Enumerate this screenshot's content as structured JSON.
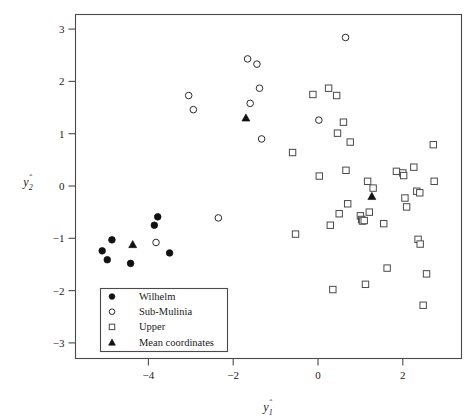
{
  "chart_data": {
    "type": "scatter",
    "title": "",
    "xlabel": "ŷ2̂",
    "axis_labels": {
      "x": "ŷ₁",
      "y": "ŷ₂"
    },
    "xlim": [
      -5.55,
      3.3
    ],
    "ylim": [
      -3.3,
      3.3
    ],
    "xticks": [
      -4,
      -2,
      0,
      2
    ],
    "yticks": [
      3,
      2,
      1,
      0,
      -1,
      -2,
      -3
    ],
    "xtick_labels": [
      "−4",
      "−2",
      "0",
      "2"
    ],
    "ytick_labels": [
      "3",
      "2",
      "1",
      "0",
      "−1",
      "−2",
      "−3"
    ],
    "grid": false,
    "legend_position": "lower-left",
    "series": [
      {
        "name": "Wilhelm",
        "marker": "filled-circle",
        "color": "#111111",
        "points": [
          [
            -5.09,
            -1.24
          ],
          [
            -4.97,
            -1.41
          ],
          [
            -4.86,
            -1.03
          ],
          [
            -4.42,
            -1.48
          ],
          [
            -3.86,
            -0.75
          ],
          [
            -3.78,
            -0.59
          ],
          [
            -3.5,
            -1.28
          ]
        ]
      },
      {
        "name": "Sub-Mulinia",
        "marker": "open-circle",
        "color": "#2b2b2b",
        "points": [
          [
            -3.82,
            -1.08
          ],
          [
            -3.05,
            1.73
          ],
          [
            -2.94,
            1.46
          ],
          [
            -2.35,
            -0.61
          ],
          [
            -1.66,
            2.43
          ],
          [
            -1.6,
            1.58
          ],
          [
            -1.44,
            2.33
          ],
          [
            -1.38,
            1.87
          ],
          [
            -1.33,
            0.9
          ],
          [
            0.02,
            1.26
          ],
          [
            0.65,
            2.84
          ]
        ]
      },
      {
        "name": "Upper",
        "marker": "open-square",
        "color": "#4a4a4a",
        "points": [
          [
            -0.6,
            0.64
          ],
          [
            -0.53,
            -0.92
          ],
          [
            -0.12,
            1.75
          ],
          [
            0.03,
            0.19
          ],
          [
            0.25,
            1.87
          ],
          [
            0.29,
            -0.75
          ],
          [
            0.35,
            -1.98
          ],
          [
            0.44,
            1.73
          ],
          [
            0.46,
            1.01
          ],
          [
            0.5,
            -0.53
          ],
          [
            0.6,
            1.22
          ],
          [
            0.66,
            0.3
          ],
          [
            0.7,
            -0.34
          ],
          [
            0.76,
            0.84
          ],
          [
            1.0,
            -0.57
          ],
          [
            1.03,
            -0.64
          ],
          [
            1.05,
            -0.67
          ],
          [
            1.09,
            -0.66
          ],
          [
            1.12,
            -1.88
          ],
          [
            1.17,
            0.09
          ],
          [
            1.21,
            -0.5
          ],
          [
            1.3,
            -0.04
          ],
          [
            1.55,
            -0.72
          ],
          [
            1.63,
            -1.57
          ],
          [
            1.85,
            0.28
          ],
          [
            2.0,
            0.25
          ],
          [
            2.02,
            0.2
          ],
          [
            2.05,
            -0.23
          ],
          [
            2.09,
            -0.4
          ],
          [
            2.26,
            0.36
          ],
          [
            2.33,
            -0.1
          ],
          [
            2.36,
            -1.02
          ],
          [
            2.4,
            -0.13
          ],
          [
            2.41,
            -1.11
          ],
          [
            2.48,
            -2.28
          ],
          [
            2.56,
            -1.68
          ],
          [
            2.72,
            0.79
          ],
          [
            2.74,
            0.09
          ]
        ]
      },
      {
        "name": "Mean coordinates",
        "marker": "filled-triangle",
        "color": "#111111",
        "points": [
          [
            -4.37,
            -1.11
          ],
          [
            -1.7,
            1.31
          ],
          [
            1.27,
            -0.19
          ]
        ]
      }
    ]
  },
  "legend": {
    "items": [
      {
        "label": "Wilhelm",
        "marker": "filled-circle"
      },
      {
        "label": "Sub-Mulinia",
        "marker": "open-circle"
      },
      {
        "label": "Upper",
        "marker": "open-square"
      },
      {
        "label": "Mean coordinates",
        "marker": "filled-triangle"
      }
    ]
  },
  "colors": {
    "background": "#ffffff",
    "frame": "#4a4a4a",
    "text": "#1a1a1a",
    "marker_fill": "#111111",
    "marker_outline": "#4a4a4a"
  }
}
